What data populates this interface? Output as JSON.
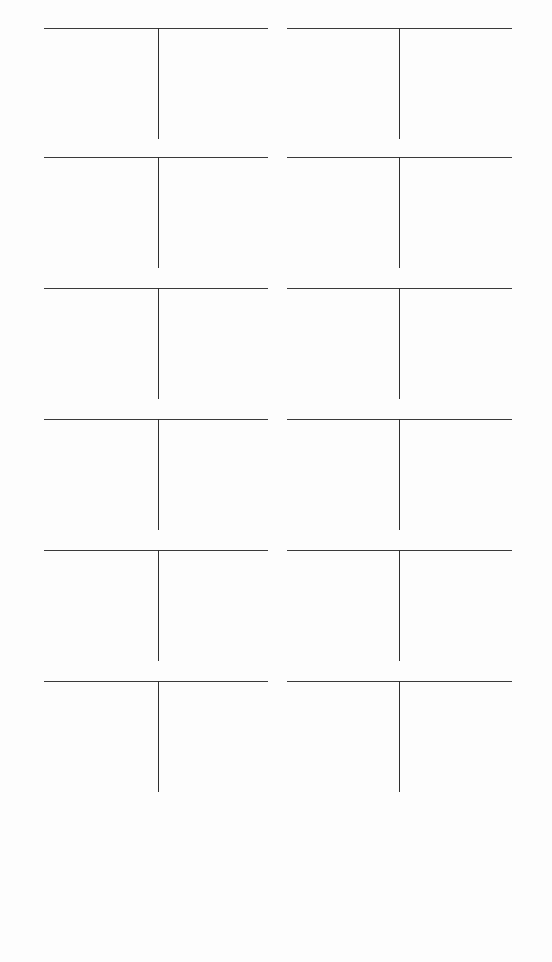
{
  "worksheet": {
    "type": "T-account worksheet",
    "colors": {
      "background": "#fdfdfd",
      "line": "#333333"
    },
    "layout": {
      "columns": 2,
      "rows": 6,
      "left_column": {
        "x": 44,
        "width": 224,
        "stem_offset": 114
      },
      "right_column": {
        "x": 287,
        "width": 225,
        "stem_offset": 112
      },
      "row_tops": [
        28,
        157,
        288,
        419,
        550,
        681
      ]
    },
    "accounts": [
      {
        "title": "",
        "debits": "",
        "credits": ""
      },
      {
        "title": "",
        "debits": "",
        "credits": ""
      },
      {
        "title": "",
        "debits": "",
        "credits": ""
      },
      {
        "title": "",
        "debits": "",
        "credits": ""
      },
      {
        "title": "",
        "debits": "",
        "credits": ""
      },
      {
        "title": "",
        "debits": "",
        "credits": ""
      },
      {
        "title": "",
        "debits": "",
        "credits": ""
      },
      {
        "title": "",
        "debits": "",
        "credits": ""
      },
      {
        "title": "",
        "debits": "",
        "credits": ""
      },
      {
        "title": "",
        "debits": "",
        "credits": ""
      },
      {
        "title": "",
        "debits": "",
        "credits": ""
      },
      {
        "title": "",
        "debits": "",
        "credits": ""
      }
    ]
  }
}
